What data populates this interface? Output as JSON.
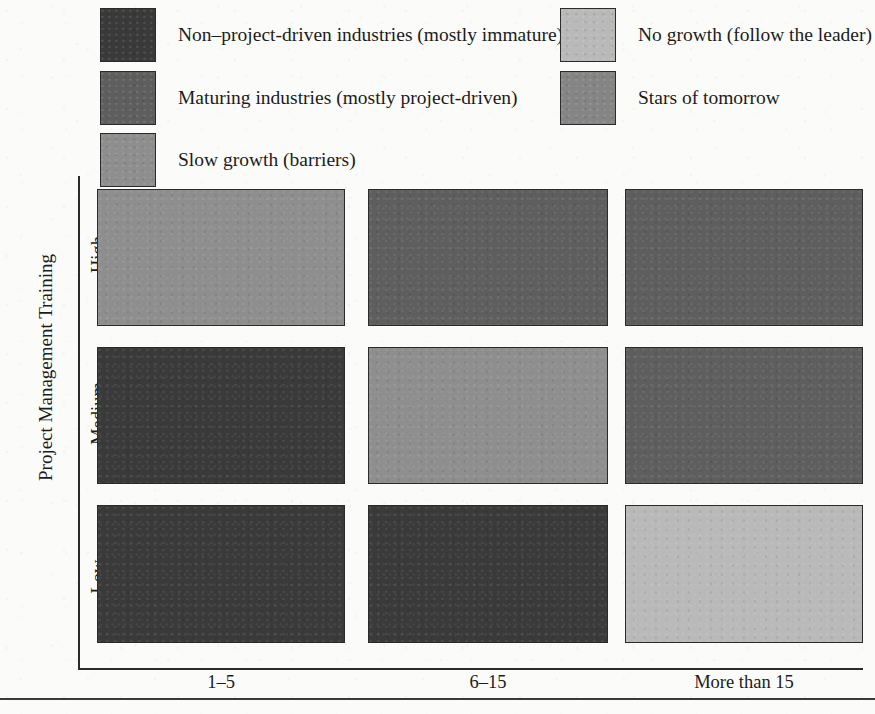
{
  "legend": {
    "items": [
      {
        "label": "Non–project-driven industries (mostly immature)",
        "color": "#3a3a3a"
      },
      {
        "label": "Maturing industries (mostly project-driven)",
        "color": "#5e5e5e"
      },
      {
        "label": "Slow growth (barriers)",
        "color": "#8e8e8e"
      },
      {
        "label": "No growth (follow the leader)",
        "color": "#b9b9b9"
      },
      {
        "label": "Stars of tomorrow",
        "color": "#858585"
      }
    ]
  },
  "chart_data": {
    "type": "heatmap",
    "title": "",
    "xlabel": "",
    "ylabel": "Project Management Training",
    "categories": [
      "1–5",
      "6–15",
      "More than 15"
    ],
    "rows": [
      "High",
      "Medium",
      "Low"
    ],
    "grid": false,
    "legend_position": "top",
    "legend_entries": [
      "Non–project-driven industries (mostly immature)",
      "Maturing industries (mostly project-driven)",
      "Slow growth (barriers)",
      "No growth (follow the leader)",
      "Stars of tomorrow"
    ],
    "category_colors": {
      "Non–project-driven industries (mostly immature)": "#3a3a3a",
      "Maturing industries (mostly project-driven)": "#5e5e5e",
      "Slow growth (barriers)": "#8e8e8e",
      "No growth (follow the leader)": "#b9b9b9",
      "Stars of tomorrow": "#858585"
    },
    "cells": [
      {
        "row": "High",
        "col": "1–5",
        "category": "Slow growth (barriers)",
        "color": "#8e8e8e"
      },
      {
        "row": "High",
        "col": "6–15",
        "category": "Maturing industries (mostly project-driven)",
        "color": "#5e5e5e"
      },
      {
        "row": "High",
        "col": "More than 15",
        "category": "Maturing industries (mostly project-driven)",
        "color": "#5e5e5e"
      },
      {
        "row": "Medium",
        "col": "1–5",
        "category": "Non–project-driven industries (mostly immature)",
        "color": "#3a3a3a"
      },
      {
        "row": "Medium",
        "col": "6–15",
        "category": "Slow growth (barriers)",
        "color": "#8e8e8e"
      },
      {
        "row": "Medium",
        "col": "More than 15",
        "category": "Maturing industries (mostly project-driven)",
        "color": "#5e5e5e"
      },
      {
        "row": "Low",
        "col": "1–5",
        "category": "Non–project-driven industries (mostly immature)",
        "color": "#3a3a3a"
      },
      {
        "row": "Low",
        "col": "6–15",
        "category": "Non–project-driven industries (mostly immature)",
        "color": "#3a3a3a"
      },
      {
        "row": "Low",
        "col": "More than 15",
        "category": "No growth (follow the leader)",
        "color": "#b9b9b9"
      }
    ]
  }
}
